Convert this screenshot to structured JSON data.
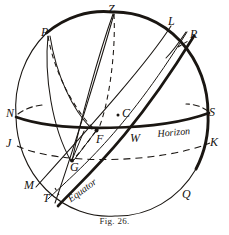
{
  "figure": {
    "caption": "Fig. 26.",
    "ink_color": "#1a1612",
    "background_color": "#ffffff"
  },
  "diagram": {
    "points": [
      {
        "key": "P",
        "label": "P",
        "x": 46,
        "y": 33
      },
      {
        "key": "Z",
        "label": "Z",
        "x": 112,
        "y": 10
      },
      {
        "key": "L",
        "label": "L",
        "x": 172,
        "y": 22
      },
      {
        "key": "R",
        "label": "R",
        "x": 194,
        "y": 35
      },
      {
        "key": "N",
        "label": "N",
        "x": 10,
        "y": 113
      },
      {
        "key": "C",
        "label": "C",
        "x": 124,
        "y": 112
      },
      {
        "key": "S",
        "label": "S",
        "x": 212,
        "y": 112
      },
      {
        "key": "J",
        "label": "J",
        "x": 10,
        "y": 143
      },
      {
        "key": "F",
        "label": "F",
        "x": 99,
        "y": 133
      },
      {
        "key": "W",
        "label": "W",
        "x": 134,
        "y": 133
      },
      {
        "key": "K",
        "label": "K",
        "x": 213,
        "y": 142
      },
      {
        "key": "G",
        "label": "G",
        "x": 72,
        "y": 159
      },
      {
        "key": "M",
        "label": "M",
        "x": 28,
        "y": 184
      },
      {
        "key": "T",
        "label": "T",
        "x": 46,
        "y": 197
      },
      {
        "key": "Q",
        "label": "Q",
        "x": 185,
        "y": 193
      }
    ],
    "curve_labels": [
      {
        "key": "horizon",
        "label": "Horizon",
        "x": 157,
        "y": 129,
        "rotation": -4
      },
      {
        "key": "equator",
        "label": "Equator",
        "x": 69,
        "y": 193,
        "rotation": -36
      }
    ],
    "center_dot": {
      "x": 118,
      "y": 115
    }
  }
}
